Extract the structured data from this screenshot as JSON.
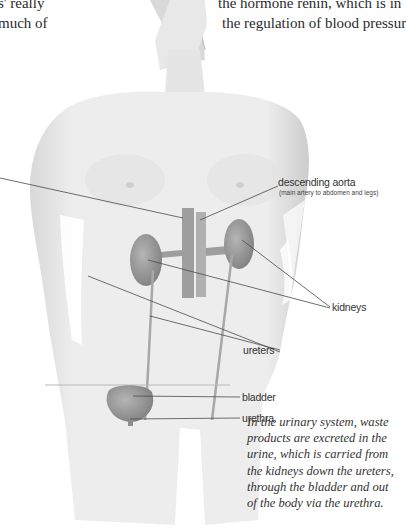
{
  "top_text": {
    "left_lines": [
      "s' really",
      "much of"
    ],
    "right_lines": [
      "the hormone renin, which is in",
      "the regulation of blood pressur"
    ]
  },
  "labels": {
    "aorta": "descending aorta",
    "aorta_sub": "(main artery to abdomen and legs)",
    "kidneys": "kidneys",
    "ureters": "ureters",
    "bladder": "bladder",
    "urethra": "urethra"
  },
  "caption": {
    "lines": [
      "In the urinary system, waste",
      "products are excreted in the",
      "urine, which is carried from",
      "the kidneys down the ureters,",
      "through the bladder and out",
      "of the body via the urethra."
    ]
  },
  "colors": {
    "skin_light": "#f2f2f2",
    "skin_mid": "#dcdcdc",
    "organ": "#9a9a9a",
    "leader_line": "#4a4a4a"
  }
}
